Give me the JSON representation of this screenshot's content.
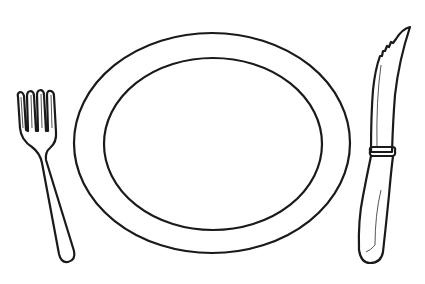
{
  "scene": {
    "description": "Line drawing of a place setting",
    "objects": [
      {
        "name": "fork",
        "position": "left"
      },
      {
        "name": "plate",
        "position": "center"
      },
      {
        "name": "knife",
        "position": "right"
      }
    ]
  },
  "colors": {
    "background": "#ffffff",
    "ink": "#1a1a1a"
  }
}
